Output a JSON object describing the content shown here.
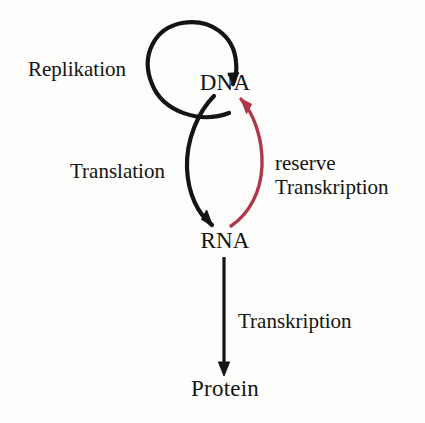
{
  "diagram": {
    "background_color": "#fdfdfb",
    "ink_color": "#141414",
    "accent_color": "#b0364a",
    "nodes": [
      {
        "id": "dna",
        "label": "DNA",
        "x": 225,
        "y": 82
      },
      {
        "id": "rna",
        "label": "RNA",
        "x": 225,
        "y": 240
      },
      {
        "id": "protein",
        "label": "Protein",
        "x": 225,
        "y": 388
      }
    ],
    "edges": [
      {
        "id": "replication",
        "label": "Replikation",
        "from": "dna",
        "to": "dna",
        "color": "#141414",
        "style": "circular-loop"
      },
      {
        "id": "translation",
        "label": "Translation",
        "from": "dna",
        "to": "rna",
        "color": "#141414",
        "style": "curve-left"
      },
      {
        "id": "reverse-transcription",
        "label_line1": "reserve",
        "label_line2": "Transkription",
        "from": "rna",
        "to": "dna",
        "color": "#b0364a",
        "style": "curve-right"
      },
      {
        "id": "transcription",
        "label": "Transkription",
        "from": "rna",
        "to": "protein",
        "color": "#141414",
        "style": "straight"
      }
    ]
  }
}
